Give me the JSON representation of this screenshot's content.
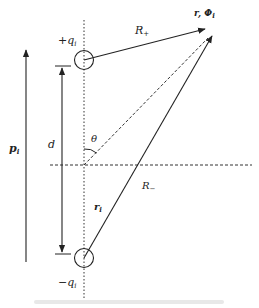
{
  "figure": {
    "labels": {
      "positive_charge": "+q",
      "positive_charge_sub": "i",
      "negative_charge": "−q",
      "negative_charge_sub": "i",
      "dipole_moment": "p",
      "dipole_moment_sub": "i",
      "separation": "d",
      "angle": "θ",
      "r_plus": "R",
      "r_plus_sub": "+",
      "r_minus": "R",
      "r_minus_sub": "−",
      "position_vector": "r",
      "position_vector_sub": "i",
      "field_point": "r, Φ",
      "field_point_sub": "i"
    },
    "colors": {
      "line": "#222222",
      "background": "#ffffff"
    }
  }
}
